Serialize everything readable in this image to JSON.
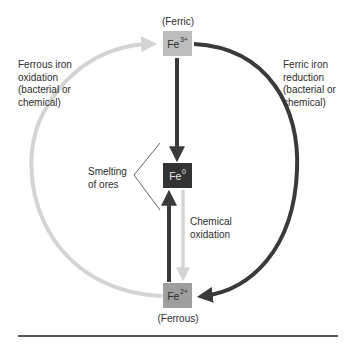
{
  "diagram": {
    "type": "iron redox cycle",
    "nodes": {
      "fe3": {
        "base": "Fe",
        "charge": "3+",
        "caption": "(Ferric)",
        "fill": "#bdbdbd"
      },
      "fe0": {
        "base": "Fe",
        "charge": "0",
        "fill": "#333333"
      },
      "fe2": {
        "base": "Fe",
        "charge": "2+",
        "caption": "(Ferrous)",
        "fill": "#9e9e9e"
      }
    },
    "labels": {
      "ferrous_oxidation": [
        "Ferrous iron",
        "oxidation",
        "(bacterial or",
        "chemical)"
      ],
      "ferric_reduction": [
        "Ferric iron",
        "reduction",
        "(bacterial or",
        "chemical)"
      ],
      "smelting": [
        "Smelting",
        "of ores"
      ],
      "chemical_oxidation": [
        "Chemical",
        "oxidation"
      ]
    },
    "edges": [
      {
        "from": "Fe2+",
        "to": "Fe3+",
        "label": "Ferrous iron oxidation (bacterial or chemical)",
        "color": "#d4d4d4"
      },
      {
        "from": "Fe3+",
        "to": "Fe2+",
        "label": "Ferric iron reduction (bacterial or chemical)",
        "color": "#3a3a3a"
      },
      {
        "from": "Fe3+",
        "to": "Fe0",
        "label": "Smelting of ores",
        "color": "#3a3a3a"
      },
      {
        "from": "Fe2+",
        "to": "Fe0",
        "label": "Smelting of ores",
        "color": "#3a3a3a"
      },
      {
        "from": "Fe0",
        "to": "Fe2+",
        "label": "Chemical oxidation",
        "color": "#d4d4d4"
      }
    ],
    "colors": {
      "dark_arrow": "#3a3a3a",
      "light_arrow": "#d4d4d4",
      "rule": "#5a5a5a"
    }
  }
}
